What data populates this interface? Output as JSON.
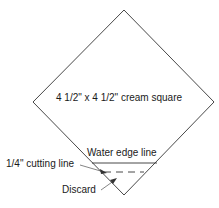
{
  "diagram": {
    "shape": "diamond (square rotated 45 degrees)",
    "labels": {
      "square": "4 1/2\" x 4 1/2\" cream square",
      "water_edge": "Water edge line",
      "cutting_line": "1/4\" cutting line",
      "discard": "Discard"
    },
    "colors": {
      "stroke": "#333333",
      "text": "#1a1a1a",
      "background": "#ffffff"
    }
  }
}
